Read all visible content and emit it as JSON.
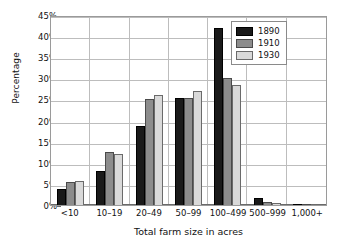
{
  "chart_data": {
    "type": "bar",
    "title": "",
    "xlabel": "Total farm size in acres",
    "ylabel": "Percentage",
    "ylim": [
      0,
      45
    ],
    "ytick_step": 5,
    "ytick_labels": [
      "0%",
      "5%",
      "10%",
      "15%",
      "20%",
      "25%",
      "30%",
      "35%",
      "40%",
      "45%"
    ],
    "ytick_values": [
      0,
      5,
      10,
      15,
      20,
      25,
      30,
      35,
      40,
      45
    ],
    "grid": true,
    "legend_position": "top-right",
    "categories": [
      "<10",
      "10–19",
      "20–49",
      "50–99",
      "100–499",
      "500–999",
      "1,000+"
    ],
    "series": [
      {
        "name": "1890",
        "color": "#1a1a1a",
        "values": [
          3.9,
          8.1,
          18.8,
          25.3,
          42.0,
          1.6,
          0.2
        ]
      },
      {
        "name": "1910",
        "color": "#8c8c8c",
        "values": [
          5.5,
          12.5,
          25.2,
          25.4,
          30.0,
          0.7,
          0.1
        ]
      },
      {
        "name": "1930",
        "color": "#d9d9d9",
        "values": [
          5.7,
          12.0,
          26.0,
          27.0,
          28.4,
          0.4,
          0.05
        ]
      }
    ]
  }
}
